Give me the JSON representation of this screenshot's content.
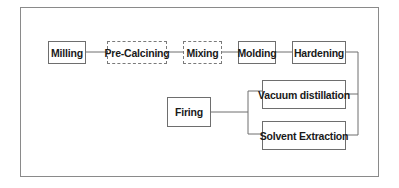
{
  "diagram": {
    "type": "process-flow",
    "nodes": [
      {
        "id": "milling",
        "label": "Milling"
      },
      {
        "id": "pre_calcining",
        "label": "Pre-Calcining"
      },
      {
        "id": "mixing",
        "label": "Mixing"
      },
      {
        "id": "molding",
        "label": "Molding"
      },
      {
        "id": "hardening",
        "label": "Hardening"
      },
      {
        "id": "vacuum_distillation",
        "label": "Vacuum distillation"
      },
      {
        "id": "solvent_extraction",
        "label": "Solvent Extraction"
      },
      {
        "id": "firing",
        "label": "Firing"
      }
    ],
    "edges": [
      {
        "from": "milling",
        "to": "pre_calcining"
      },
      {
        "from": "pre_calcining",
        "to": "mixing"
      },
      {
        "from": "mixing",
        "to": "molding"
      },
      {
        "from": "molding",
        "to": "hardening"
      },
      {
        "from": "hardening",
        "to": "vacuum_distillation"
      },
      {
        "from": "hardening",
        "to": "solvent_extraction"
      },
      {
        "from": "vacuum_distillation",
        "to": "firing"
      },
      {
        "from": "solvent_extraction",
        "to": "firing"
      }
    ],
    "colors": {
      "line": "#6e6e6e",
      "frame": "#8a8a8a",
      "text": "#1a1a1a",
      "background": "#ffffff"
    }
  }
}
